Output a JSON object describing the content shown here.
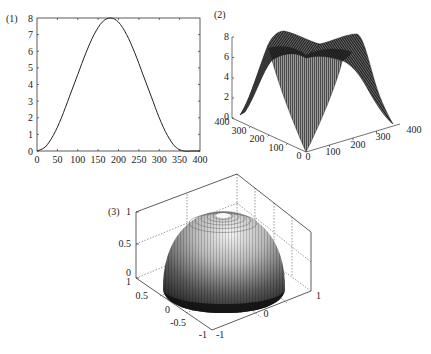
{
  "chart_data": [
    {
      "id": "plot1",
      "label": "(1)",
      "type": "line",
      "title": "",
      "xlabel": "",
      "ylabel": "",
      "xlim": [
        0,
        400
      ],
      "ylim": [
        0,
        8
      ],
      "x_ticks": [
        0,
        50,
        100,
        150,
        200,
        250,
        300,
        350,
        400
      ],
      "y_ticks": [
        0,
        1,
        2,
        3,
        4,
        5,
        6,
        7,
        8
      ],
      "grid": false,
      "series": [
        {
          "name": "curve",
          "x": [
            0,
            20,
            40,
            60,
            80,
            100,
            120,
            140,
            160,
            180,
            200,
            220,
            240,
            260,
            280,
            300,
            320,
            340,
            360,
            380,
            400
          ],
          "values": [
            0,
            0.24,
            0.94,
            2.0,
            3.3,
            4.6,
            5.9,
            7.0,
            7.75,
            8.0,
            7.75,
            7.0,
            5.9,
            4.6,
            3.3,
            2.0,
            0.94,
            0.24,
            0,
            0,
            0
          ]
        }
      ]
    },
    {
      "id": "plot2",
      "label": "(2)",
      "type": "surface",
      "title": "",
      "x_ticks": [
        0,
        100,
        200,
        300,
        400
      ],
      "y_ticks": [
        0,
        100,
        200,
        300,
        400
      ],
      "z_ticks": [
        0,
        2,
        4,
        6,
        8
      ],
      "xlim": [
        0,
        400
      ],
      "ylim": [
        0,
        400
      ],
      "zlim": [
        0,
        8
      ],
      "description": "mesh surface: peaks of 8 along the two back edges, saddle between, falls to 0 at the near corner and the two side corners"
    },
    {
      "id": "plot3",
      "label": "(3)",
      "type": "surface",
      "title": "",
      "x_ticks": [
        -1,
        0,
        1
      ],
      "y_ticks": [
        -1,
        -0.5,
        0,
        0.5,
        1
      ],
      "z_ticks": [
        0,
        0.5,
        1
      ],
      "xlim": [
        -1,
        1
      ],
      "ylim": [
        -1,
        1
      ],
      "zlim": [
        0,
        1
      ],
      "grid": true,
      "description": "unit hemisphere z = sqrt(1 - x^2 - y^2), shaded surface with contour rings near the top"
    }
  ],
  "plot1": {
    "label": "(1)",
    "x_tick_labels": [
      "0",
      "50",
      "100",
      "150",
      "200",
      "250",
      "300",
      "350",
      "400"
    ],
    "y_tick_labels": [
      "0",
      "1",
      "2",
      "3",
      "4",
      "5",
      "6",
      "7",
      "8"
    ]
  },
  "plot2": {
    "label": "(2)",
    "z_tick_labels": [
      "0",
      "2",
      "4",
      "6",
      "8"
    ],
    "left_axis_labels": [
      "400",
      "300",
      "200",
      "100",
      "0"
    ],
    "right_axis_labels": [
      "0",
      "100",
      "200",
      "300",
      "400"
    ]
  },
  "plot3": {
    "label": "(3)",
    "z_tick_labels": [
      "0",
      "0.5",
      "1"
    ],
    "left_axis_labels": [
      "1",
      "0.5",
      "0",
      "-0.5",
      "-1"
    ],
    "right_axis_labels": [
      "-1",
      "0",
      "1"
    ]
  }
}
